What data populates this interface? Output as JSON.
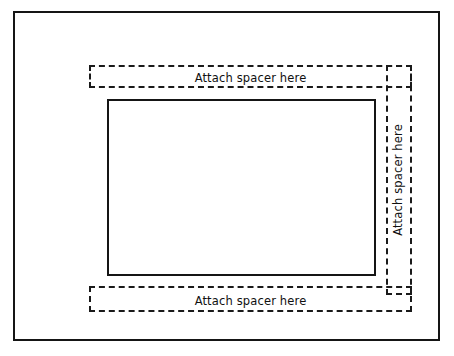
{
  "diagram": {
    "background_color": "#ffffff",
    "line_color": "#151515",
    "outer_frame": {
      "style": "solid"
    },
    "inner_rect": {
      "style": "solid"
    },
    "spacers": [
      {
        "id": "top",
        "label": "Attach spacer here",
        "orientation": "horizontal",
        "style": "dashed"
      },
      {
        "id": "right",
        "label": "Attach spacer here",
        "orientation": "vertical",
        "style": "dashed"
      },
      {
        "id": "bottom",
        "label": "Attach spacer here",
        "orientation": "horizontal",
        "style": "dashed"
      }
    ]
  }
}
